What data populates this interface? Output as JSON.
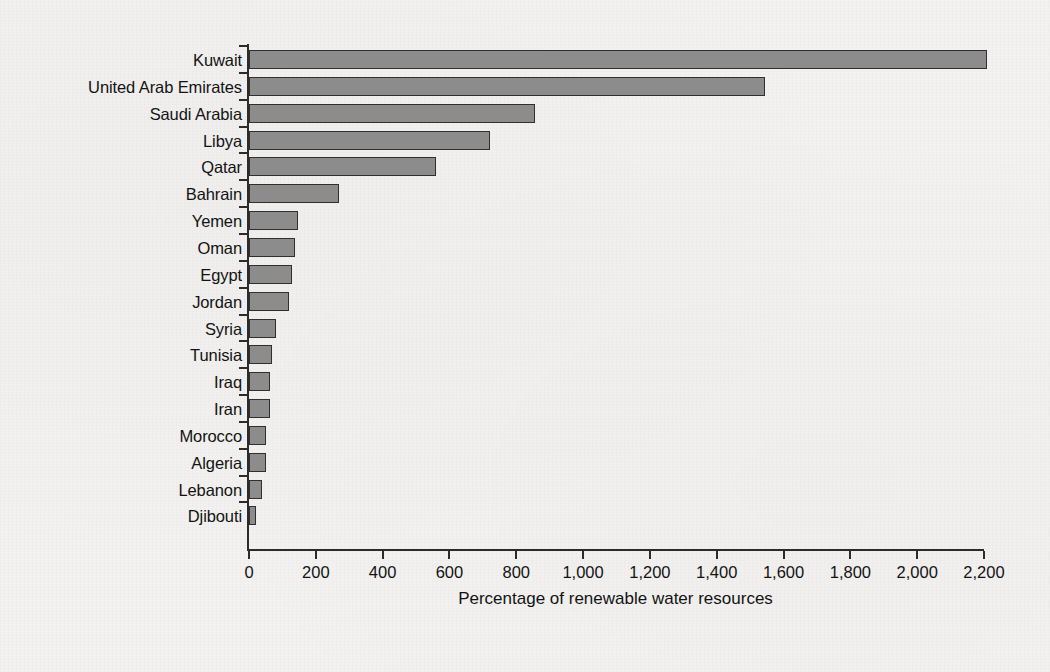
{
  "chart_data": {
    "type": "bar",
    "orientation": "horizontal",
    "title": "",
    "xlabel": "Percentage of renewable water resources",
    "ylabel": "",
    "xlim": [
      0,
      2200
    ],
    "xticks": [
      0,
      200,
      400,
      600,
      800,
      1000,
      1200,
      1400,
      1600,
      1800,
      2000,
      2200
    ],
    "xtick_labels": [
      "0",
      "200",
      "400",
      "600",
      "800",
      "1,000",
      "1,200",
      "1,400",
      "1,600",
      "1,800",
      "2,000",
      "2,200"
    ],
    "grid": false,
    "legend": null,
    "bar_fill_color": "#8c8c8c",
    "bar_edge_color": "#2f2f2f",
    "background_color": "#f3f2f0",
    "axis_color": "#2b2b2b",
    "categories": [
      "Kuwait",
      "United Arab Emirates",
      "Saudi Arabia",
      "Libya",
      "Qatar",
      "Bahrain",
      "Yemen",
      "Oman",
      "Egypt",
      "Jordan",
      "Syria",
      "Tunisia",
      "Iraq",
      "Iran",
      "Morocco",
      "Algeria",
      "Lebanon",
      "Djibouti"
    ],
    "values": [
      2210,
      1545,
      855,
      720,
      560,
      270,
      148,
      137,
      128,
      120,
      82,
      68,
      62,
      62,
      52,
      52,
      40,
      22
    ]
  }
}
